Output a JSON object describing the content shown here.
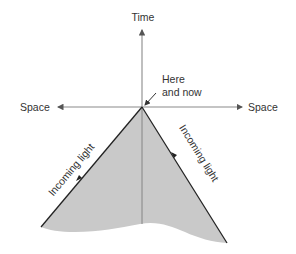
{
  "diagram": {
    "type": "light-cone",
    "labels": {
      "time_axis": "Time",
      "space_left": "Space",
      "space_right": "Space",
      "apex_line1": "Here",
      "apex_line2": "and now",
      "left_edge": "Incoming light",
      "right_edge": "Incoming light"
    },
    "colors": {
      "cone_fill": "#c9c9c9",
      "axis": "#8a8a8a",
      "edge": "#222222",
      "text": "#333333"
    }
  }
}
